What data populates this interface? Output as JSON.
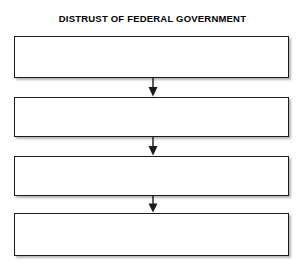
{
  "diagram": {
    "title": "DISTRUST OF FEDERAL GOVERNMENT",
    "type": "vertical-flowchart",
    "background_color": "#ffffff",
    "border_color": "#1b1b1b",
    "shadow_color": "#787878",
    "text_color": "#000000",
    "nodes": [
      {
        "id": "node-1",
        "label": ""
      },
      {
        "id": "node-2",
        "label": ""
      },
      {
        "id": "node-3",
        "label": ""
      },
      {
        "id": "node-4",
        "label": ""
      }
    ],
    "connectors": [
      {
        "id": "connector-1",
        "from": "node-1",
        "to": "node-2",
        "direction": "down"
      },
      {
        "id": "connector-2",
        "from": "node-2",
        "to": "node-3",
        "direction": "down"
      },
      {
        "id": "connector-3",
        "from": "node-3",
        "to": "node-4",
        "direction": "down"
      }
    ]
  }
}
